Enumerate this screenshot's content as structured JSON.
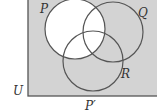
{
  "diagram": {
    "type": "venn",
    "universe_label": "U",
    "caption": "P′",
    "shaded_region": "complement of P",
    "sets": [
      {
        "name": "P",
        "label": "P"
      },
      {
        "name": "Q",
        "label": "Q"
      },
      {
        "name": "R",
        "label": "R"
      }
    ],
    "colors": {
      "shade": "#d3d3d3",
      "unshaded": "#ffffff",
      "stroke": "#555555"
    }
  }
}
